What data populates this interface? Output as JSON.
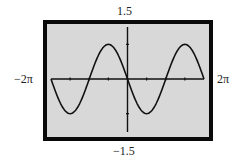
{
  "window": {
    "ymax_label": "1.5",
    "ymin_label": "−1.5",
    "xmin_label": "−2π",
    "xmax_label": "2π"
  },
  "colors": {
    "screen_background": "#d8d8d8",
    "frame": "#0a0a0a",
    "axes": "#111111",
    "curve": "#111111"
  },
  "chart_data": {
    "type": "line",
    "title": "",
    "function": "y = -sin(x)",
    "xlabel": "",
    "ylabel": "",
    "xlim": [
      -6.2832,
      6.2832
    ],
    "ylim": [
      -1.5,
      1.5
    ],
    "xlim_labels": [
      "−2π",
      "2π"
    ],
    "ylim_labels": [
      "−1.5",
      "1.5"
    ],
    "x_ticks": [
      "-3π/2",
      "-π",
      "-π/2",
      "0",
      "π/2",
      "π",
      "3π/2"
    ],
    "y_ticks": [
      -1,
      1
    ],
    "grid": false,
    "legend": "none",
    "series": [
      {
        "name": "-sin(x)",
        "x": [
          -6.2832,
          -5.4978,
          -4.7124,
          -3.927,
          -3.1416,
          -2.3562,
          -1.5708,
          -0.7854,
          0,
          0.7854,
          1.5708,
          2.3562,
          3.1416,
          3.927,
          4.7124,
          5.4978,
          6.2832
        ],
        "values": [
          0,
          -0.707,
          -1,
          -0.707,
          0,
          0.707,
          1,
          0.707,
          0,
          -0.707,
          -1,
          -0.707,
          0,
          0.707,
          1,
          0.707,
          0
        ]
      }
    ],
    "key_points": {
      "minima": [
        [
          -4.7124,
          -1
        ],
        [
          1.5708,
          -1
        ]
      ],
      "maxima": [
        [
          -1.5708,
          1
        ],
        [
          4.7124,
          1
        ]
      ],
      "zeros": [
        -6.2832,
        -3.1416,
        0,
        3.1416,
        6.2832
      ]
    }
  }
}
